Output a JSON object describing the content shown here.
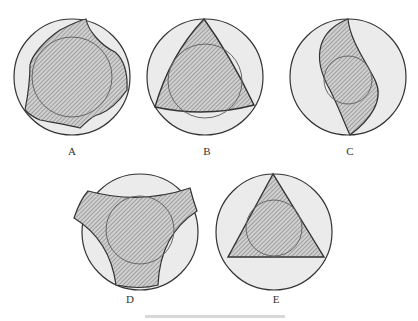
{
  "figure": {
    "panels": [
      {
        "id": "A",
        "label": "A",
        "cx": 72,
        "cy": 77,
        "shape": "irregular-cam"
      },
      {
        "id": "B",
        "label": "B",
        "cx": 205,
        "cy": 77,
        "shape": "reuleaux-triangle"
      },
      {
        "id": "C",
        "label": "C",
        "cx": 348,
        "cy": 77,
        "shape": "s-curve-lens"
      },
      {
        "id": "D",
        "label": "D",
        "cx": 140,
        "cy": 232,
        "shape": "concave-triangle"
      },
      {
        "id": "E",
        "label": "E",
        "cx": 274,
        "cy": 232,
        "shape": "equilateral-triangle"
      }
    ],
    "caption": ""
  },
  "colors": {
    "outer_fill": "#ebebeb",
    "stroke": "#333333",
    "hatch": "#777777"
  }
}
